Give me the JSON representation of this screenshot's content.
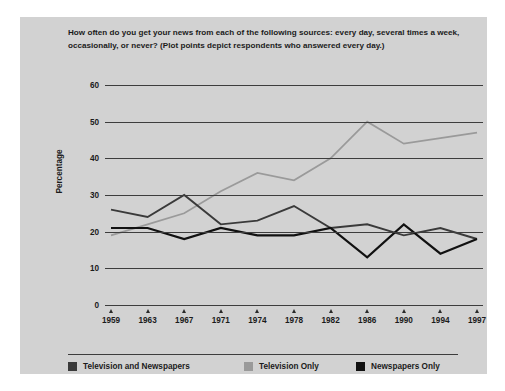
{
  "figure": {
    "title": "How often do you get your news from each of the following sources: every day, several times a week, occasionally, or never? (Plot points depict respondents who answered every day.)",
    "panel_color": "#d2d2d2",
    "axis_color": "#3d3d3d"
  },
  "chart_data": {
    "type": "line",
    "title": "How often do you get your news from each of the following sources: every day, several times a week, occasionally, or never? (Plot points depict respondents who answered every day.)",
    "xlabel": "",
    "ylabel": "Percentage",
    "categories": [
      "1959",
      "1963",
      "1967",
      "1971",
      "1974",
      "1978",
      "1982",
      "1986",
      "1990",
      "1994",
      "1997"
    ],
    "ylim": [
      0,
      60
    ],
    "yticks": [
      "0",
      "10",
      "20",
      "30",
      "40",
      "50",
      "60"
    ],
    "grid": true,
    "legend_position": "bottom",
    "series": [
      {
        "name": "Television and Newspapers",
        "color": "#3a3a3a",
        "values": [
          26,
          24,
          30,
          22,
          23,
          27,
          21,
          22,
          19,
          21,
          18
        ]
      },
      {
        "name": "Television Only",
        "color": "#9a9a9a",
        "values": [
          19,
          22,
          25,
          31,
          36,
          34,
          40,
          50,
          44,
          45.5,
          47
        ]
      },
      {
        "name": "Newspapers Only",
        "color": "#111111",
        "values": [
          21,
          21,
          18,
          21,
          19,
          19,
          21,
          13,
          22,
          14,
          18
        ]
      }
    ]
  }
}
